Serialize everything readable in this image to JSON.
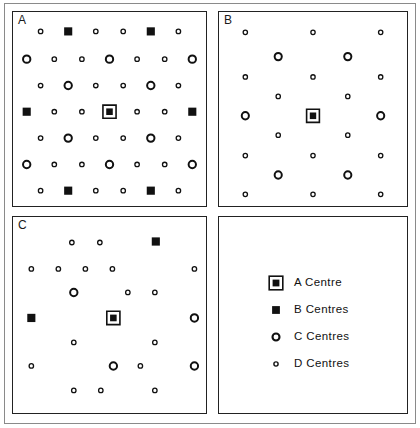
{
  "figure": {
    "panels": [
      {
        "id": "A",
        "label": "A"
      },
      {
        "id": "B",
        "label": "B"
      },
      {
        "id": "C",
        "label": "C"
      },
      {
        "id": "D",
        "label": ""
      }
    ]
  },
  "legend": {
    "items": [
      {
        "marker": "a-centre-marker",
        "label": "A  Centre"
      },
      {
        "marker": "b-centre-marker",
        "label": "B  Centres"
      },
      {
        "marker": "c-centre-marker",
        "label": "C  Centres"
      },
      {
        "marker": "d-centre-marker",
        "label": "D  Centres"
      }
    ]
  },
  "colors": {
    "ink": "#111111",
    "frame": "#8a8a8a",
    "panel_border": "#222222",
    "background": "#ffffff"
  },
  "marker_styles": {
    "A": {
      "type": "square-in-square",
      "outer_size": 13,
      "inner_size": 7
    },
    "B": {
      "type": "filled-square",
      "size": 8
    },
    "C": {
      "type": "open-circle",
      "radius": 4.2,
      "stroke": 2.0
    },
    "D": {
      "type": "open-circle-small",
      "radius": 2.4,
      "stroke": 1.3
    }
  },
  "chart_data": {
    "type": "scatter",
    "title": "",
    "xlabel": "",
    "ylabel": "",
    "grid": false,
    "legend_position": "bottom-right-panel",
    "axis_ranges": {
      "xlim": [
        0,
        100
      ],
      "ylim": [
        0,
        100
      ]
    },
    "marker_classes": [
      "A",
      "B",
      "C",
      "D"
    ],
    "panels": [
      {
        "name": "A",
        "description": "Regular square lattice, 7 columns x 7 rows, alternating C/D centres with B centres at the four mid-edge and corner-adjacent sites and the A centre at the exact middle.",
        "points": [
          {
            "x": 14.3,
            "y": 10.0,
            "type": "D"
          },
          {
            "x": 28.6,
            "y": 10.0,
            "type": "B"
          },
          {
            "x": 42.9,
            "y": 10.0,
            "type": "D"
          },
          {
            "x": 57.1,
            "y": 10.0,
            "type": "D"
          },
          {
            "x": 71.4,
            "y": 10.0,
            "type": "B"
          },
          {
            "x": 85.7,
            "y": 10.0,
            "type": "D"
          },
          {
            "x": 7.1,
            "y": 24.3,
            "type": "C"
          },
          {
            "x": 21.4,
            "y": 24.3,
            "type": "D"
          },
          {
            "x": 35.7,
            "y": 24.3,
            "type": "D"
          },
          {
            "x": 50.0,
            "y": 24.3,
            "type": "C"
          },
          {
            "x": 64.3,
            "y": 24.3,
            "type": "D"
          },
          {
            "x": 78.6,
            "y": 24.3,
            "type": "D"
          },
          {
            "x": 92.9,
            "y": 24.3,
            "type": "C"
          },
          {
            "x": 14.3,
            "y": 37.9,
            "type": "D"
          },
          {
            "x": 28.6,
            "y": 37.9,
            "type": "C"
          },
          {
            "x": 42.9,
            "y": 37.9,
            "type": "D"
          },
          {
            "x": 57.1,
            "y": 37.9,
            "type": "D"
          },
          {
            "x": 71.4,
            "y": 37.9,
            "type": "C"
          },
          {
            "x": 85.7,
            "y": 37.9,
            "type": "D"
          },
          {
            "x": 7.1,
            "y": 51.4,
            "type": "B"
          },
          {
            "x": 21.4,
            "y": 51.4,
            "type": "D"
          },
          {
            "x": 35.7,
            "y": 51.4,
            "type": "D"
          },
          {
            "x": 50.0,
            "y": 51.4,
            "type": "A"
          },
          {
            "x": 64.3,
            "y": 51.4,
            "type": "D"
          },
          {
            "x": 78.6,
            "y": 51.4,
            "type": "D"
          },
          {
            "x": 92.9,
            "y": 51.4,
            "type": "B"
          },
          {
            "x": 14.3,
            "y": 65.0,
            "type": "D"
          },
          {
            "x": 28.6,
            "y": 65.0,
            "type": "C"
          },
          {
            "x": 42.9,
            "y": 65.0,
            "type": "D"
          },
          {
            "x": 57.1,
            "y": 65.0,
            "type": "D"
          },
          {
            "x": 71.4,
            "y": 65.0,
            "type": "C"
          },
          {
            "x": 85.7,
            "y": 65.0,
            "type": "D"
          },
          {
            "x": 7.1,
            "y": 78.6,
            "type": "C"
          },
          {
            "x": 21.4,
            "y": 78.6,
            "type": "D"
          },
          {
            "x": 35.7,
            "y": 78.6,
            "type": "D"
          },
          {
            "x": 50.0,
            "y": 78.6,
            "type": "C"
          },
          {
            "x": 64.3,
            "y": 78.6,
            "type": "D"
          },
          {
            "x": 78.6,
            "y": 78.6,
            "type": "D"
          },
          {
            "x": 92.9,
            "y": 78.6,
            "type": "C"
          },
          {
            "x": 14.3,
            "y": 92.1,
            "type": "D"
          },
          {
            "x": 28.6,
            "y": 92.1,
            "type": "B"
          },
          {
            "x": 42.9,
            "y": 92.1,
            "type": "D"
          },
          {
            "x": 57.1,
            "y": 92.1,
            "type": "D"
          },
          {
            "x": 71.4,
            "y": 92.1,
            "type": "B"
          },
          {
            "x": 85.7,
            "y": 92.1,
            "type": "D"
          }
        ]
      },
      {
        "name": "B",
        "description": "Sparser symmetric lattice: three columns of D centres, four C centres in a square about the middle, and the A centre at the exact middle.",
        "points": [
          {
            "x": 14.0,
            "y": 10.5,
            "type": "D"
          },
          {
            "x": 50.0,
            "y": 10.5,
            "type": "D"
          },
          {
            "x": 86.0,
            "y": 10.5,
            "type": "D"
          },
          {
            "x": 31.5,
            "y": 23.0,
            "type": "C"
          },
          {
            "x": 68.5,
            "y": 23.0,
            "type": "C"
          },
          {
            "x": 14.0,
            "y": 33.5,
            "type": "D"
          },
          {
            "x": 50.0,
            "y": 33.5,
            "type": "D"
          },
          {
            "x": 86.0,
            "y": 33.5,
            "type": "D"
          },
          {
            "x": 31.5,
            "y": 43.5,
            "type": "D"
          },
          {
            "x": 68.5,
            "y": 43.5,
            "type": "D"
          },
          {
            "x": 14.0,
            "y": 53.5,
            "type": "C"
          },
          {
            "x": 50.0,
            "y": 53.5,
            "type": "A"
          },
          {
            "x": 86.0,
            "y": 53.5,
            "type": "C"
          },
          {
            "x": 31.5,
            "y": 63.5,
            "type": "D"
          },
          {
            "x": 68.5,
            "y": 63.5,
            "type": "D"
          },
          {
            "x": 14.0,
            "y": 74.0,
            "type": "D"
          },
          {
            "x": 50.0,
            "y": 74.0,
            "type": "D"
          },
          {
            "x": 86.0,
            "y": 74.0,
            "type": "D"
          },
          {
            "x": 31.5,
            "y": 84.0,
            "type": "C"
          },
          {
            "x": 68.5,
            "y": 84.0,
            "type": "C"
          },
          {
            "x": 14.0,
            "y": 94.0,
            "type": "D"
          },
          {
            "x": 50.0,
            "y": 94.0,
            "type": "D"
          },
          {
            "x": 86.0,
            "y": 94.0,
            "type": "D"
          }
        ]
      },
      {
        "name": "C",
        "description": "Irregular / lower-symmetry arrangement: scattered D centres, a few C centres, two B centres at upper-right and mid-left, and the A centre near the middle.",
        "points": [
          {
            "x": 30.5,
            "y": 13.0,
            "type": "D"
          },
          {
            "x": 45.0,
            "y": 13.0,
            "type": "D"
          },
          {
            "x": 74.0,
            "y": 12.5,
            "type": "B"
          },
          {
            "x": 9.5,
            "y": 26.5,
            "type": "D"
          },
          {
            "x": 23.5,
            "y": 26.5,
            "type": "D"
          },
          {
            "x": 37.5,
            "y": 26.5,
            "type": "D"
          },
          {
            "x": 51.5,
            "y": 26.5,
            "type": "D"
          },
          {
            "x": 94.0,
            "y": 26.5,
            "type": "D"
          },
          {
            "x": 31.5,
            "y": 38.5,
            "type": "C"
          },
          {
            "x": 59.5,
            "y": 38.5,
            "type": "D"
          },
          {
            "x": 73.5,
            "y": 38.5,
            "type": "D"
          },
          {
            "x": 9.5,
            "y": 51.5,
            "type": "B"
          },
          {
            "x": 52.0,
            "y": 51.5,
            "type": "A"
          },
          {
            "x": 94.0,
            "y": 51.5,
            "type": "C"
          },
          {
            "x": 31.5,
            "y": 64.0,
            "type": "D"
          },
          {
            "x": 73.5,
            "y": 64.0,
            "type": "D"
          },
          {
            "x": 9.5,
            "y": 76.0,
            "type": "D"
          },
          {
            "x": 52.0,
            "y": 76.0,
            "type": "C"
          },
          {
            "x": 66.0,
            "y": 76.0,
            "type": "D"
          },
          {
            "x": 94.0,
            "y": 76.0,
            "type": "C"
          },
          {
            "x": 31.5,
            "y": 88.5,
            "type": "D"
          },
          {
            "x": 45.5,
            "y": 88.5,
            "type": "D"
          },
          {
            "x": 73.5,
            "y": 88.5,
            "type": "D"
          }
        ]
      }
    ]
  }
}
